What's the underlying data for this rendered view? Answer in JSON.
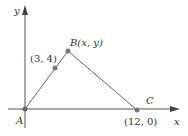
{
  "figure": {
    "axes": {
      "x_label": "x",
      "y_label": "y"
    },
    "points": {
      "A": {
        "label": "A",
        "coords": ""
      },
      "mid": {
        "label": "(3, 4)"
      },
      "B": {
        "label_letter": "B",
        "label_coords": "(x, y)"
      },
      "C": {
        "label": "C",
        "coords": "(12, 0)"
      }
    },
    "colors": {
      "axis": "#555555",
      "segment": "#666666",
      "point": "#777777",
      "text": "#333333"
    }
  }
}
